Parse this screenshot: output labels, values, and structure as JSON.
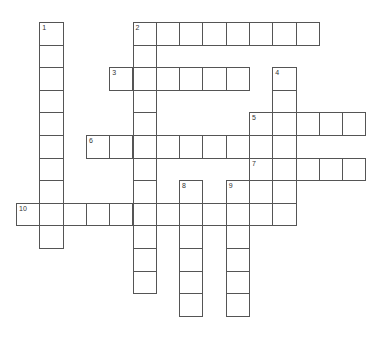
{
  "puzzle": {
    "type": "crossword",
    "grid": {
      "origin_x": 16,
      "origin_y": 22,
      "cell_w": 23.3,
      "cell_h": 22.6
    },
    "words": [
      {
        "number": "1",
        "direction": "down",
        "row": 0,
        "col": 1,
        "length": 10
      },
      {
        "number": "2",
        "direction": "across",
        "row": 0,
        "col": 5,
        "length": 8
      },
      {
        "number": "2",
        "direction": "down",
        "row": 0,
        "col": 5,
        "length": 12
      },
      {
        "number": "3",
        "direction": "across",
        "row": 2,
        "col": 4,
        "length": 6
      },
      {
        "number": "4",
        "direction": "down",
        "row": 2,
        "col": 11,
        "length": 7
      },
      {
        "number": "5",
        "direction": "across",
        "row": 4,
        "col": 10,
        "length": 5
      },
      {
        "number": "6",
        "direction": "across",
        "row": 5,
        "col": 3,
        "length": 9
      },
      {
        "number": "7",
        "direction": "across",
        "row": 6,
        "col": 10,
        "length": 5
      },
      {
        "number": "8",
        "direction": "down",
        "row": 7,
        "col": 7,
        "length": 6
      },
      {
        "number": "9",
        "direction": "down",
        "row": 7,
        "col": 9,
        "length": 6
      },
      {
        "number": "10",
        "direction": "across",
        "row": 8,
        "col": 0,
        "length": 12
      }
    ],
    "colors": {
      "border": "#555555",
      "cell_bg": "#ffffff",
      "number": "#333333"
    }
  }
}
